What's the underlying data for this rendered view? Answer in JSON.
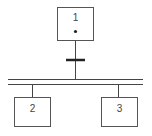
{
  "diagram": {
    "type": "grafcet",
    "steps": [
      {
        "id": "1",
        "label": "1",
        "active": true
      },
      {
        "id": "2",
        "label": "2",
        "active": false
      },
      {
        "id": "3",
        "label": "3",
        "active": false
      }
    ],
    "transitions": [
      {
        "from": "1",
        "to": "divergence"
      }
    ],
    "divergence": {
      "type": "simultaneous-and",
      "branches": [
        "2",
        "3"
      ]
    }
  },
  "colors": {
    "stroke": "#444444",
    "background": "#ffffff"
  }
}
